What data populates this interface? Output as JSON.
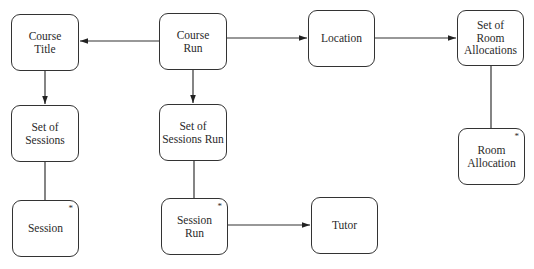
{
  "diagram": {
    "nodes": [
      {
        "id": "course_title",
        "label": "Course\nTitle",
        "multi": false,
        "x": 11,
        "y": 14,
        "w": 68,
        "h": 57
      },
      {
        "id": "course_run",
        "label": "Course\nRun",
        "multi": false,
        "x": 159,
        "y": 13,
        "w": 68,
        "h": 57
      },
      {
        "id": "location",
        "label": "Location",
        "multi": false,
        "x": 308,
        "y": 10,
        "w": 67,
        "h": 57
      },
      {
        "id": "set_room_allocations",
        "label": "Set of\nRoom\nAllocations",
        "multi": false,
        "x": 457,
        "y": 10,
        "w": 67,
        "h": 56
      },
      {
        "id": "set_of_sessions",
        "label": "Set of\nSessions",
        "multi": false,
        "x": 11,
        "y": 105,
        "w": 68,
        "h": 57
      },
      {
        "id": "set_sessions_run",
        "label": "Set of\nSessions Run",
        "multi": false,
        "x": 159,
        "y": 104,
        "w": 68,
        "h": 57
      },
      {
        "id": "room_allocation",
        "label": "Room\nAllocation",
        "multi": true,
        "x": 458,
        "y": 128,
        "w": 67,
        "h": 57
      },
      {
        "id": "session",
        "label": "Session",
        "multi": true,
        "x": 12,
        "y": 200,
        "w": 67,
        "h": 57
      },
      {
        "id": "session_run",
        "label": "Session\nRun",
        "multi": true,
        "x": 161,
        "y": 198,
        "w": 67,
        "h": 57
      },
      {
        "id": "tutor",
        "label": "Tutor",
        "multi": false,
        "x": 311,
        "y": 197,
        "w": 67,
        "h": 57
      }
    ],
    "edges": [
      {
        "from": "course_run",
        "to": "course_title",
        "arrow": true
      },
      {
        "from": "course_run",
        "to": "location",
        "arrow": true
      },
      {
        "from": "location",
        "to": "set_room_allocations",
        "arrow": true
      },
      {
        "from": "course_title",
        "to": "set_of_sessions",
        "arrow": true
      },
      {
        "from": "course_run",
        "to": "set_sessions_run",
        "arrow": true
      },
      {
        "from": "set_of_sessions",
        "to": "session",
        "arrow": false
      },
      {
        "from": "set_sessions_run",
        "to": "session_run",
        "arrow": false
      },
      {
        "from": "set_room_allocations",
        "to": "room_allocation",
        "arrow": false
      },
      {
        "from": "session_run",
        "to": "tutor",
        "arrow": true
      }
    ],
    "multiplicity_marker": "*",
    "colors": {
      "line": "#333333",
      "background": "#ffffff"
    }
  }
}
